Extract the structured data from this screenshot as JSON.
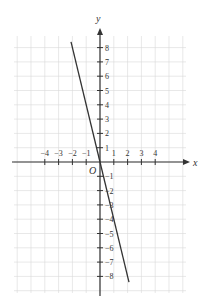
{
  "chart_data": {
    "type": "line",
    "title": "",
    "xlabel": "x",
    "ylabel": "y",
    "origin_label": "O",
    "xlim": [
      -4.5,
      4.5
    ],
    "ylim": [
      -9,
      9
    ],
    "grid": true,
    "x_ticks": [
      -4,
      -3,
      -2,
      -1,
      1,
      2,
      3,
      4
    ],
    "x_tick_labels": [
      "−4",
      "−3",
      "−2",
      "−1",
      "1",
      "2",
      "3",
      "4"
    ],
    "y_ticks": [
      8,
      7,
      6,
      5,
      4,
      3,
      2,
      1,
      -1,
      -2,
      -3,
      -4,
      -5,
      -6,
      -7,
      -8
    ],
    "y_tick_labels": [
      "8",
      "7",
      "6",
      "5",
      "4",
      "3",
      "2",
      "1",
      "−1",
      "−2",
      "−3",
      "−4",
      "−5",
      "−6",
      "−7",
      "−8"
    ],
    "series": [
      {
        "name": "y = -4x",
        "equation": "y = -4x",
        "x": [
          -2.1,
          0,
          2.1
        ],
        "y": [
          8.4,
          0,
          -8.4
        ]
      }
    ],
    "colors": {
      "line": "#333333",
      "axis": "#333333",
      "grid": "#d8d8d8"
    }
  }
}
